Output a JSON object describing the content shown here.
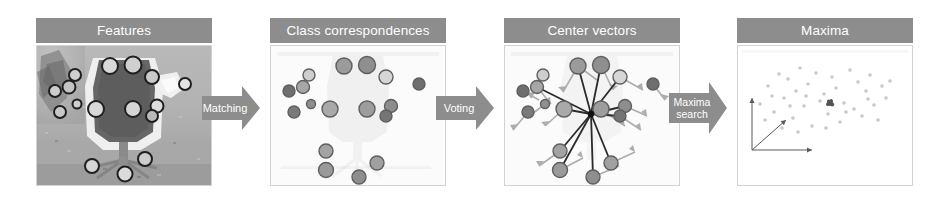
{
  "diagram": {
    "panels": [
      {
        "id": "features",
        "label": "Features",
        "description": "Grayscale photograph of an office chair with detected interest points marked as circles",
        "content_type": "image-with-keypoints",
        "keypoint_count": 16
      },
      {
        "id": "class-correspondences",
        "label": "Class correspondences",
        "description": "Faint chair silhouette with matched codebook entries drawn as filled gray discs",
        "content_type": "filled-discs",
        "disc_count": 16
      },
      {
        "id": "center-vectors",
        "label": "Center vectors",
        "description": "Each matched feature casts vectors toward the hypothesised object center",
        "content_type": "vector-field",
        "disc_count": 16
      },
      {
        "id": "maxima",
        "label": "Maxima",
        "description": "Voting space scatter of hypotheses with a single dense maximum and 3D coordinate axes",
        "content_type": "scatter-plot",
        "point_count": 40,
        "maxima_count": 1
      }
    ],
    "arrows": [
      {
        "id": "matching",
        "label": "Matching",
        "lines": [
          "Matching"
        ]
      },
      {
        "id": "voting",
        "label": "Voting",
        "lines": [
          "Voting"
        ]
      },
      {
        "id": "maxima-search",
        "label": "Maxima search",
        "lines": [
          "Maxima",
          "search"
        ]
      }
    ],
    "colors": {
      "header_bar": "#8d8d8d",
      "header_text": "#ffffff",
      "arrow_fill": "#8d8d8d",
      "arrow_text": "#ffffff",
      "panel_border": "#d2d2d2",
      "page_background": "#ffffff",
      "disc_dark": "#6e6e6e",
      "disc_mid": "#9b9b9b",
      "disc_light": "#d6d6d6",
      "vector_dark": "#2b2b2b",
      "vector_light": "#a8a8a8",
      "scatter_point": "#c9c9c9",
      "scatter_maximum": "#555555"
    }
  },
  "chart_data": {
    "type": "scatter",
    "title": "Maxima",
    "xlabel": "",
    "ylabel": "",
    "legend": "none",
    "grid": false,
    "xlim": [
      0,
      174
    ],
    "ylim": [
      0,
      139
    ],
    "series": [
      {
        "name": "hypotheses",
        "color": "#c9c9c9",
        "points": [
          [
            22,
            58
          ],
          [
            30,
            40
          ],
          [
            36,
            66
          ],
          [
            41,
            28
          ],
          [
            46,
            52
          ],
          [
            50,
            33
          ],
          [
            55,
            72
          ],
          [
            58,
            45
          ],
          [
            62,
            22
          ],
          [
            66,
            60
          ],
          [
            70,
            38
          ],
          [
            74,
            80
          ],
          [
            78,
            27
          ],
          [
            82,
            55
          ],
          [
            86,
            48
          ],
          [
            90,
            68
          ],
          [
            94,
            31
          ],
          [
            98,
            42
          ],
          [
            102,
            76
          ],
          [
            106,
            57
          ],
          [
            112,
            24
          ],
          [
            116,
            63
          ],
          [
            120,
            36
          ],
          [
            124,
            70
          ],
          [
            128,
            45
          ],
          [
            132,
            29
          ],
          [
            136,
            59
          ],
          [
            140,
            74
          ],
          [
            144,
            40
          ],
          [
            148,
            52
          ],
          [
            27,
            74
          ],
          [
            34,
            50
          ],
          [
            44,
            82
          ],
          [
            52,
            60
          ],
          [
            60,
            86
          ],
          [
            68,
            50
          ],
          [
            88,
            82
          ],
          [
            108,
            66
          ],
          [
            130,
            53
          ],
          [
            152,
            35
          ]
        ]
      },
      {
        "name": "maximum",
        "color": "#555555",
        "points": [
          [
            92,
            57
          ]
        ]
      }
    ],
    "axes_triad": {
      "origin": [
        14,
        104
      ],
      "y_axis_tip": [
        14,
        52
      ],
      "x_axis_tip": [
        74,
        104
      ],
      "z_axis_tip": [
        48,
        74
      ]
    }
  }
}
